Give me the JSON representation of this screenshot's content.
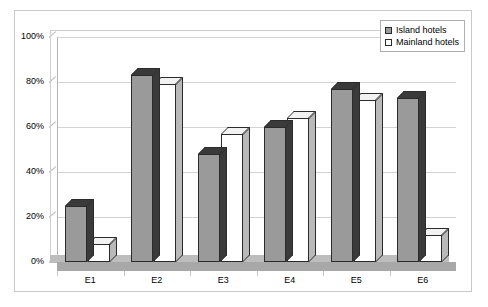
{
  "chart_data": {
    "type": "bar",
    "title": "",
    "xlabel": "",
    "ylabel": "",
    "categories": [
      "E1",
      "E2",
      "E3",
      "E4",
      "E5",
      "E6"
    ],
    "series": [
      {
        "name": "Island hotels",
        "color": "#9a9a9a",
        "values": [
          25,
          83,
          48,
          60,
          77,
          73
        ]
      },
      {
        "name": "Mainland hotels",
        "color": "#ffffff",
        "values": [
          8,
          79,
          57,
          64,
          72,
          12
        ]
      }
    ],
    "ylim": [
      0,
      100
    ],
    "ytick_labels": [
      "0%",
      "20%",
      "40%",
      "60%",
      "80%",
      "100%"
    ],
    "ytick_values": [
      0,
      20,
      40,
      60,
      80,
      100
    ],
    "grid": true,
    "legend_position": "top-right",
    "three_d": true
  },
  "legend": {
    "items": [
      {
        "label": "Island hotels",
        "swatch": "filled-gray-square"
      },
      {
        "label": "Mainland hotels",
        "swatch": "empty-white-square"
      }
    ]
  },
  "axes": {
    "y_labels": [
      "100%",
      "80%",
      "60%",
      "40%",
      "20%",
      "0%"
    ],
    "x_labels": [
      "E1",
      "E2",
      "E3",
      "E4",
      "E5",
      "E6"
    ]
  }
}
